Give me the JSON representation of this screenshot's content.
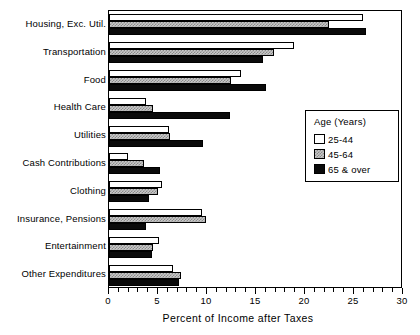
{
  "chart_data": {
    "type": "bar",
    "orientation": "horizontal",
    "title": "",
    "xlabel": "Percent of Income after Taxes",
    "ylabel": "",
    "xlim": [
      0,
      30
    ],
    "xticks": [
      0,
      5,
      10,
      15,
      20,
      25,
      30
    ],
    "xtick_labels": [
      "0",
      "5",
      "10",
      "15",
      "20",
      "25",
      "30"
    ],
    "minor_tick_step": 1,
    "grid": false,
    "legend_position": "right-middle",
    "legend_title": "Age  (Years)",
    "categories": [
      "Housing, Exc. Util.",
      "Transportation",
      "Food",
      "Health Care",
      "Utilities",
      "Cash Contributions",
      "Clothing",
      "Insurance, Pensions",
      "Entertainment",
      "Other Expenditures"
    ],
    "series": [
      {
        "name": "25-44",
        "fill": "white",
        "values": [
          25.9,
          18.9,
          13.5,
          3.8,
          6.1,
          1.9,
          5.4,
          9.5,
          5.1,
          6.5
        ]
      },
      {
        "name": "45-64",
        "fill": "gray-hatch",
        "values": [
          22.4,
          16.8,
          12.4,
          4.5,
          6.2,
          3.6,
          5.0,
          9.9,
          4.5,
          7.3
        ]
      },
      {
        "name": "65 & over",
        "fill": "black",
        "values": [
          26.2,
          15.7,
          16.0,
          12.3,
          9.6,
          5.2,
          4.1,
          3.8,
          4.4,
          7.1
        ]
      }
    ]
  },
  "legend": {
    "title": "Age  (Years)",
    "entries": [
      {
        "label": "25-44",
        "swatch": "white-swatch"
      },
      {
        "label": "45-64",
        "swatch": "gray-hatch-swatch"
      },
      {
        "label": "65 & over",
        "swatch": "black-swatch"
      }
    ]
  },
  "colors": {
    "series_25_44": "#ffffff",
    "series_45_64": "#c9c9c9",
    "series_65_over": "#0a0a0a",
    "axis": "#000000",
    "background": "#ffffff"
  }
}
